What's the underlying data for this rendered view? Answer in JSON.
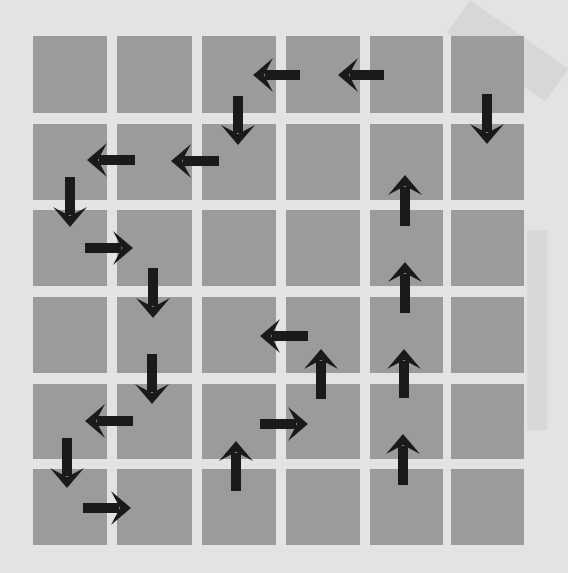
{
  "diagram": {
    "type": "grid-arrow-path",
    "rows": 6,
    "cols": 6,
    "colors": {
      "background": "#e3e3e3",
      "cell": "#9b9b9b",
      "arrow": "#1a1a1a",
      "shade": "#cfcfcf"
    },
    "columns_x": [
      [
        33,
        107
      ],
      [
        117,
        192
      ],
      [
        202,
        276
      ],
      [
        286,
        360
      ],
      [
        370,
        443
      ],
      [
        451,
        524
      ]
    ],
    "rows_y": [
      [
        36,
        113
      ],
      [
        124,
        200
      ],
      [
        210,
        286
      ],
      [
        297,
        373
      ],
      [
        384,
        459
      ],
      [
        469,
        545
      ]
    ],
    "arrows": [
      {
        "dir": "left",
        "x1": 300,
        "y1": 75,
        "x2": 253,
        "y2": 75
      },
      {
        "dir": "left",
        "x1": 384,
        "y1": 75,
        "x2": 338,
        "y2": 75
      },
      {
        "dir": "down",
        "x1": 238,
        "y1": 96,
        "x2": 238,
        "y2": 145
      },
      {
        "dir": "down",
        "x1": 487,
        "y1": 94,
        "x2": 487,
        "y2": 144
      },
      {
        "dir": "left",
        "x1": 135,
        "y1": 160,
        "x2": 87,
        "y2": 160
      },
      {
        "dir": "left",
        "x1": 219,
        "y1": 161,
        "x2": 171,
        "y2": 161
      },
      {
        "dir": "down",
        "x1": 70,
        "y1": 177,
        "x2": 70,
        "y2": 227
      },
      {
        "dir": "right",
        "x1": 85,
        "y1": 248,
        "x2": 133,
        "y2": 248
      },
      {
        "dir": "down",
        "x1": 153,
        "y1": 268,
        "x2": 153,
        "y2": 318
      },
      {
        "dir": "up",
        "x1": 405,
        "y1": 226,
        "x2": 405,
        "y2": 175
      },
      {
        "dir": "up",
        "x1": 405,
        "y1": 313,
        "x2": 405,
        "y2": 262
      },
      {
        "dir": "left",
        "x1": 308,
        "y1": 336,
        "x2": 260,
        "y2": 336
      },
      {
        "dir": "up",
        "x1": 321,
        "y1": 399,
        "x2": 321,
        "y2": 349
      },
      {
        "dir": "down",
        "x1": 152,
        "y1": 354,
        "x2": 152,
        "y2": 404
      },
      {
        "dir": "up",
        "x1": 404,
        "y1": 398,
        "x2": 404,
        "y2": 349
      },
      {
        "dir": "left",
        "x1": 133,
        "y1": 421,
        "x2": 85,
        "y2": 421
      },
      {
        "dir": "right",
        "x1": 260,
        "y1": 424,
        "x2": 308,
        "y2": 424
      },
      {
        "dir": "down",
        "x1": 67,
        "y1": 438,
        "x2": 67,
        "y2": 488
      },
      {
        "dir": "up",
        "x1": 236,
        "y1": 491,
        "x2": 236,
        "y2": 441
      },
      {
        "dir": "up",
        "x1": 403,
        "y1": 485,
        "x2": 403,
        "y2": 434
      },
      {
        "dir": "right",
        "x1": 83,
        "y1": 508,
        "x2": 131,
        "y2": 508
      }
    ]
  }
}
